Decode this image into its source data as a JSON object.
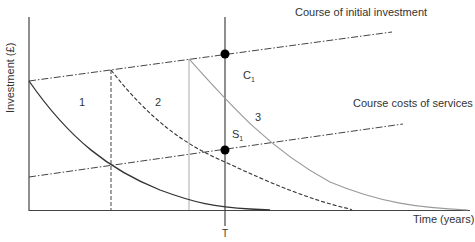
{
  "diagram": {
    "axes": {
      "y_label": "Investment (£)",
      "x_label": "Time (years)",
      "t_marker": "T"
    },
    "lines": {
      "initial_investment_label": "Course of initial investment",
      "services_label": "Course costs of services"
    },
    "points": {
      "c_main": "C",
      "c_sub": "1",
      "s_main": "S",
      "s_sub": "1"
    },
    "curves": [
      {
        "label": "1",
        "style": "solid",
        "color": "#333333"
      },
      {
        "label": "2",
        "style": "dashed",
        "color": "#333333"
      },
      {
        "label": "3",
        "style": "solid-light",
        "color": "#9a9a9a"
      }
    ]
  }
}
